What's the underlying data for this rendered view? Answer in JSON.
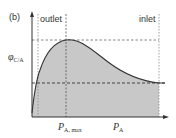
{
  "panel_label": "(b)",
  "regions": {
    "outlet": "outlet",
    "inlet": "inlet"
  },
  "y_axis": {
    "symbol": "φ",
    "subscript": "C/A"
  },
  "x_axis": {
    "tick_label": {
      "main": "P",
      "subscript": "A, max"
    },
    "axis_label": {
      "main": "P",
      "subscript": "A"
    }
  },
  "colors": {
    "fill": "#c8c8c8",
    "curve": "#333333",
    "axis": "#333333",
    "dashed": "#555555",
    "dotted": "#888888"
  }
}
